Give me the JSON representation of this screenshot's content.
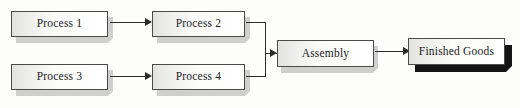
{
  "diagram": {
    "type": "flowchart",
    "background_color": "#fdfdfc",
    "line_color": "#2b2b2b",
    "box_border_color": "#4a4a4a",
    "shadow_color_light": "#cfcfcd",
    "shadow_color_dark": "#141414",
    "nodes": [
      {
        "id": "process1",
        "label": "Process 1",
        "shadow": "light"
      },
      {
        "id": "process2",
        "label": "Process 2",
        "shadow": "light"
      },
      {
        "id": "process3",
        "label": "Process 3",
        "shadow": "light"
      },
      {
        "id": "process4",
        "label": "Process 4",
        "shadow": "light"
      },
      {
        "id": "assembly",
        "label": "Assembly",
        "shadow": "light"
      },
      {
        "id": "finished_goods",
        "label": "Finished Goods",
        "shadow": "dark"
      }
    ],
    "edges": [
      {
        "from": "process1",
        "to": "process2"
      },
      {
        "from": "process3",
        "to": "process4"
      },
      {
        "from": "process2",
        "to": "assembly"
      },
      {
        "from": "process4",
        "to": "assembly"
      },
      {
        "from": "assembly",
        "to": "finished_goods"
      }
    ]
  }
}
